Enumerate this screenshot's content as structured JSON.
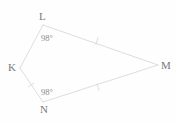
{
  "figure": {
    "type": "geometry-quadrilateral-diagram",
    "background_color": "#fefefe",
    "stroke_color": "#d9d9d9",
    "label_color": "#7a7a7a",
    "angle_label_color": "#8a8a8a",
    "width": 176,
    "height": 122,
    "shape_name": "KLMN",
    "vertices": [
      {
        "id": "L",
        "label": "L",
        "x": 43,
        "y": 25,
        "label_x": 39,
        "label_y": 11
      },
      {
        "id": "M",
        "label": "M",
        "x": 158,
        "y": 65,
        "label_x": 161,
        "label_y": 60
      },
      {
        "id": "N",
        "label": "N",
        "x": 43,
        "y": 102,
        "label_x": 40,
        "label_y": 104
      },
      {
        "id": "K",
        "label": "K",
        "x": 20,
        "y": 68,
        "label_x": 8,
        "label_y": 62
      }
    ],
    "edges": [
      {
        "id": "KL",
        "from": "K",
        "to": "L",
        "ticks": 0
      },
      {
        "id": "LM",
        "from": "L",
        "to": "M",
        "ticks": 1,
        "tick_x": 97,
        "tick_y": 41
      },
      {
        "id": "MN",
        "from": "M",
        "to": "N",
        "ticks": 1,
        "tick_x": 98,
        "tick_y": 87
      },
      {
        "id": "NK",
        "from": "N",
        "to": "K",
        "ticks": 1,
        "tick_x": 31,
        "tick_y": 85
      }
    ],
    "angles": [
      {
        "id": "angle-L",
        "at_vertex": "L",
        "value": "98°",
        "x": 41,
        "y": 34
      },
      {
        "id": "angle-N",
        "at_vertex": "N",
        "value": "98°",
        "x": 41,
        "y": 88
      }
    ]
  }
}
